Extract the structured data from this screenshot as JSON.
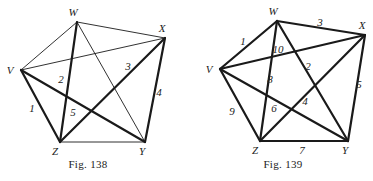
{
  "figures": [
    {
      "id": "fig138",
      "caption": "Fig. 138",
      "caption_pos": [
        88,
        168
      ],
      "vertices": {
        "W": {
          "x": 77,
          "y": 22,
          "lx": 73,
          "ly": 16
        },
        "X": {
          "x": 165,
          "y": 38,
          "lx": 162,
          "ly": 32
        },
        "V": {
          "x": 21,
          "y": 70,
          "lx": 10,
          "ly": 74
        },
        "Z": {
          "x": 60,
          "y": 142,
          "lx": 55,
          "ly": 155
        },
        "Y": {
          "x": 145,
          "y": 142,
          "lx": 142,
          "ly": 155
        }
      },
      "edges": [
        {
          "from": "V",
          "to": "Z",
          "weight": "bold",
          "label": "1",
          "lx": 32,
          "ly": 112
        },
        {
          "from": "Z",
          "to": "W",
          "weight": "bold",
          "label": "2",
          "lx": 61,
          "ly": 83
        },
        {
          "from": "Z",
          "to": "X",
          "weight": "bold",
          "label": "3",
          "lx": 128,
          "ly": 70
        },
        {
          "from": "X",
          "to": "Y",
          "weight": "bold",
          "label": "4",
          "lx": 159,
          "ly": 96
        },
        {
          "from": "Y",
          "to": "V",
          "weight": "bold",
          "label": "5",
          "lx": 73,
          "ly": 116
        },
        {
          "from": "V",
          "to": "W",
          "weight": "thin",
          "label": ""
        },
        {
          "from": "W",
          "to": "X",
          "weight": "thin",
          "label": ""
        },
        {
          "from": "V",
          "to": "X",
          "weight": "thin",
          "label": ""
        },
        {
          "from": "W",
          "to": "Y",
          "weight": "thin",
          "label": ""
        },
        {
          "from": "Z",
          "to": "Y",
          "weight": "thin",
          "label": ""
        }
      ]
    },
    {
      "id": "fig139",
      "caption": "Fig. 139",
      "caption_pos": [
        283,
        168
      ],
      "vertices": {
        "W": {
          "x": 277,
          "y": 21,
          "lx": 273,
          "ly": 15
        },
        "X": {
          "x": 365,
          "y": 35,
          "lx": 362,
          "ly": 29
        },
        "V": {
          "x": 220,
          "y": 69,
          "lx": 209,
          "ly": 73
        },
        "Z": {
          "x": 260,
          "y": 141,
          "lx": 255,
          "ly": 154
        },
        "Y": {
          "x": 348,
          "y": 141,
          "lx": 345,
          "ly": 154
        }
      },
      "edges": [
        {
          "from": "V",
          "to": "W",
          "weight": "bold",
          "label": "1",
          "lx": 243,
          "ly": 45
        },
        {
          "from": "W",
          "to": "Y",
          "weight": "bold",
          "label": "2",
          "lx": 308,
          "ly": 70
        },
        {
          "from": "W",
          "to": "X",
          "weight": "bold",
          "label": "3",
          "lx": 320,
          "ly": 26
        },
        {
          "from": "X",
          "to": "Z",
          "weight": "bold",
          "label": "4",
          "lx": 305,
          "ly": 105
        },
        {
          "from": "X",
          "to": "Y",
          "weight": "bold",
          "label": "5",
          "lx": 359,
          "ly": 88
        },
        {
          "from": "Y",
          "to": "V",
          "weight": "bold",
          "label": "6",
          "lx": 274,
          "ly": 112
        },
        {
          "from": "Z",
          "to": "Y",
          "weight": "bold",
          "label": "7",
          "lx": 302,
          "ly": 154
        },
        {
          "from": "Z",
          "to": "W",
          "weight": "bold",
          "label": "8",
          "lx": 270,
          "ly": 83
        },
        {
          "from": "V",
          "to": "Z",
          "weight": "bold",
          "label": "9",
          "lx": 232,
          "ly": 115
        },
        {
          "from": "V",
          "to": "X",
          "weight": "bold",
          "label": "10",
          "lx": 278,
          "ly": 53
        }
      ]
    }
  ]
}
